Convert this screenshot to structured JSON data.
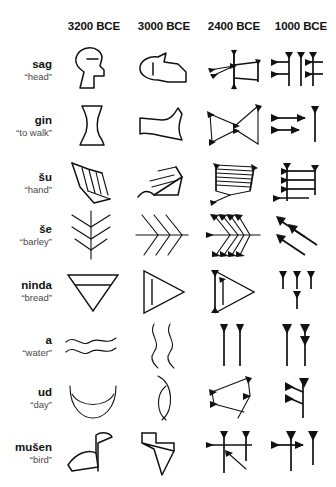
{
  "figure": {
    "type": "table",
    "columns": [
      "3200 BCE",
      "3000 BCE",
      "2400 BCE",
      "1000 BCE"
    ],
    "ink_color": "#111111",
    "background_color": "#ffffff"
  },
  "header": {
    "cols": [
      {
        "label": "3200 BCE"
      },
      {
        "label": "3000 BCE"
      },
      {
        "label": "2400 BCE"
      },
      {
        "label": "1000 BCE"
      }
    ]
  },
  "rows": [
    {
      "term": "sag",
      "gloss": "“head”",
      "signs": [
        {
          "period": "3200 BCE",
          "style": "pictograph",
          "desc": "profile of a human head outline with eye stroke"
        },
        {
          "period": "3000 BCE",
          "style": "rotated-pictograph",
          "desc": "head turned 90°, rounded outline"
        },
        {
          "period": "2400 BCE",
          "style": "early-cuneiform",
          "desc": "linear wedge skeleton of head sign"
        },
        {
          "period": "1000 BCE",
          "style": "late-cuneiform",
          "desc": "assyrian wedge cluster, two vertical strokes with horizontals"
        }
      ]
    },
    {
      "term": "gin",
      "gloss": "“to walk”",
      "signs": [
        {
          "period": "3200 BCE",
          "style": "pictograph",
          "desc": "outline of a leg and foot"
        },
        {
          "period": "3000 BCE",
          "style": "rotated-pictograph",
          "desc": "leg rotated, angular outline"
        },
        {
          "period": "2400 BCE",
          "style": "early-cuneiform",
          "desc": "bowtie of linear wedges"
        },
        {
          "period": "1000 BCE",
          "style": "late-cuneiform",
          "desc": "two horizontal wedges plus vertical"
        }
      ]
    },
    {
      "term": "šu",
      "gloss": "“hand”",
      "signs": [
        {
          "period": "3200 BCE",
          "style": "pictograph",
          "desc": "hand with four fingers"
        },
        {
          "period": "3000 BCE",
          "style": "rotated-pictograph",
          "desc": "hand rotated, fingers as parallel strokes"
        },
        {
          "period": "2400 BCE",
          "style": "early-cuneiform",
          "desc": "ruled box of horizontal lines with foot wedges"
        },
        {
          "period": "1000 BCE",
          "style": "late-cuneiform",
          "desc": "vertical with four horizontal wedges"
        }
      ]
    },
    {
      "term": "še",
      "gloss": "“barley”",
      "signs": [
        {
          "period": "3200 BCE",
          "style": "pictograph",
          "desc": "ear of barley, upright stalk with chevrons"
        },
        {
          "period": "3000 BCE",
          "style": "rotated-pictograph",
          "desc": "barley rotated 90°, horizontal stalk"
        },
        {
          "period": "2400 BCE",
          "style": "early-cuneiform",
          "desc": "stalk with stacked wedge pairs"
        },
        {
          "period": "1000 BCE",
          "style": "late-cuneiform",
          "desc": "three oblique wedges"
        }
      ]
    },
    {
      "term": "ninda",
      "gloss": "“bread”",
      "signs": [
        {
          "period": "3200 BCE",
          "style": "pictograph",
          "desc": "downward triangle with inner line"
        },
        {
          "period": "3000 BCE",
          "style": "rotated-pictograph",
          "desc": "triangle pointing right with inner line"
        },
        {
          "period": "2400 BCE",
          "style": "early-cuneiform",
          "desc": "triangle with thick left wedge edge"
        },
        {
          "period": "1000 BCE",
          "style": "late-cuneiform",
          "desc": "three vertical wedges over one"
        }
      ]
    },
    {
      "term": "a",
      "gloss": "“water”",
      "signs": [
        {
          "period": "3200 BCE",
          "style": "pictograph",
          "desc": "two horizontal wavy lines"
        },
        {
          "period": "3000 BCE",
          "style": "rotated-pictograph",
          "desc": "two vertical wavy lines"
        },
        {
          "period": "2400 BCE",
          "style": "early-cuneiform",
          "desc": "two long vertical wedges"
        },
        {
          "period": "1000 BCE",
          "style": "late-cuneiform",
          "desc": "two vertical wedges with extra head"
        }
      ]
    },
    {
      "term": "ud",
      "gloss": "“day”",
      "signs": [
        {
          "period": "3200 BCE",
          "style": "pictograph",
          "desc": "sun rising over horizon, lens shape"
        },
        {
          "period": "3000 BCE",
          "style": "rotated-pictograph",
          "desc": "lens shape rotated vertically"
        },
        {
          "period": "2400 BCE",
          "style": "early-cuneiform",
          "desc": "angular quadrilateral of wedges"
        },
        {
          "period": "1000 BCE",
          "style": "late-cuneiform",
          "desc": "vertical wedge with two left wedges"
        }
      ]
    },
    {
      "term": "mušen",
      "gloss": "“bird”",
      "signs": [
        {
          "period": "3200 BCE",
          "style": "pictograph",
          "desc": "bird body with head and tail outline"
        },
        {
          "period": "3000 BCE",
          "style": "rotated-pictograph",
          "desc": "bird rotated, angular outline"
        },
        {
          "period": "2400 BCE",
          "style": "early-cuneiform",
          "desc": "crossed horizontal and verticals with oblique"
        },
        {
          "period": "1000 BCE",
          "style": "late-cuneiform",
          "desc": "horizontal wedge crossing vertical plus second vertical"
        }
      ]
    }
  ]
}
